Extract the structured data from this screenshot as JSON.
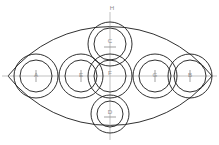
{
  "diagram": {
    "type": "technical-line-drawing",
    "canvas": {
      "width": 219,
      "height": 145
    },
    "colors": {
      "stroke": "#1a1a1a",
      "background": "#ffffff",
      "centerline": "#a8a8a8",
      "label": "#8f8f8f"
    },
    "outline": {
      "name": "lens",
      "left_vertex": {
        "x": 8,
        "y": 76
      },
      "right_vertex": {
        "x": 212,
        "y": 76
      },
      "top_point": {
        "x": 110,
        "y": 18
      },
      "bottom_point": {
        "x": 110,
        "y": 134
      }
    },
    "centerlines": {
      "horizontal": {
        "x1": 2,
        "y1": 76,
        "x2": 217,
        "y2": 76
      },
      "vertical": {
        "x1": 110,
        "y1": 12,
        "x2": 110,
        "y2": 140
      }
    },
    "circles": [
      {
        "label": "A",
        "cx": 36,
        "cy": 76,
        "r_outer": 22,
        "r_inner": 16
      },
      {
        "label": "E",
        "cx": 81,
        "cy": 76,
        "r_outer": 22,
        "r_inner": 16
      },
      {
        "label": "F",
        "cx": 110,
        "cy": 76,
        "r_outer": 22,
        "r_inner": 16
      },
      {
        "label": "G",
        "cx": 155,
        "cy": 76,
        "r_outer": 22,
        "r_inner": 16
      },
      {
        "label": "B",
        "cx": 190,
        "cy": 76,
        "r_outer": 22,
        "r_inner": 16
      },
      {
        "label": "C",
        "cx": 110,
        "cy": 44,
        "r_outer": 22,
        "r_inner": 16
      },
      {
        "label": "D",
        "cx": 110,
        "cy": 114,
        "r_outer": 19,
        "r_inner": 13
      }
    ],
    "vertex_labels": [
      {
        "label": "H",
        "x": 110,
        "y": 8
      }
    ]
  }
}
